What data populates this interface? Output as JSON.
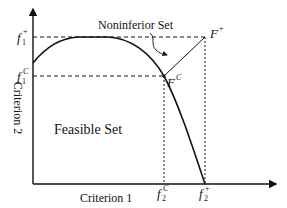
{
  "diagram": {
    "axes": {
      "x_label": "Criterion 1",
      "y_label": "Criterion 2"
    },
    "labels": {
      "noninferior_set": "Noninferior Set",
      "feasible_set": "Feasible Set",
      "ideal_point": {
        "base": "F",
        "sup": "+"
      },
      "compromise_point": {
        "base": "F",
        "sup": "C"
      },
      "f1_plus": {
        "base": "f",
        "sub": "1",
        "sup": "+"
      },
      "f1_c": {
        "base": "f",
        "sub": "1",
        "sup": "C"
      },
      "f2_c": {
        "base": "f",
        "sub": "2",
        "sup": "C"
      },
      "f2_plus": {
        "base": "f",
        "sub": "2",
        "sup": "+"
      }
    },
    "colors": {
      "line": "#111111",
      "background": "#ffffff"
    }
  }
}
